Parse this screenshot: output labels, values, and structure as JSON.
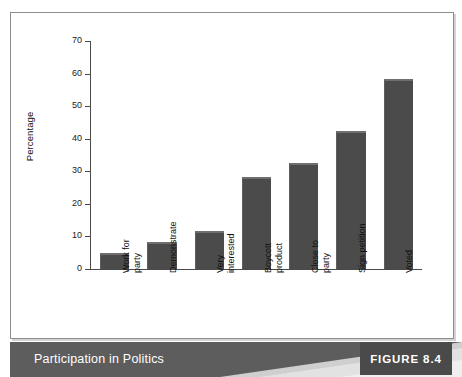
{
  "figure": {
    "caption": "Participation in Politics",
    "tag": "FIGURE 8.4"
  },
  "colors": {
    "bar_fill": "#4b4b4b",
    "bar_highlight": "#6f6f6f",
    "axis": "#4a4a4a",
    "frame": "#8d8d8d",
    "band_dark": "#5d5d5d",
    "band_light": "#dcdcdc",
    "tag_bg": "#4a4a4a",
    "caption_text": "#ffffff"
  },
  "chart_data": {
    "type": "bar",
    "title": "Participation in Politics",
    "xlabel": "",
    "ylabel": "Percentage",
    "ylim": [
      0,
      70
    ],
    "yticks": [
      0,
      10,
      20,
      30,
      40,
      50,
      60,
      70
    ],
    "ytick_labels": [
      "0",
      "10",
      "20",
      "30",
      "40",
      "50",
      "60",
      "70"
    ],
    "grid": false,
    "legend": false,
    "categories": [
      "Work for\nparty",
      "Demonstrate",
      "Very\ninterested",
      "Boycott\nproduct",
      "Close to\nparty",
      "Sign petition",
      "Voted"
    ],
    "values": [
      4.8,
      8.3,
      11.7,
      28.2,
      32.6,
      42.5,
      58.3
    ]
  }
}
